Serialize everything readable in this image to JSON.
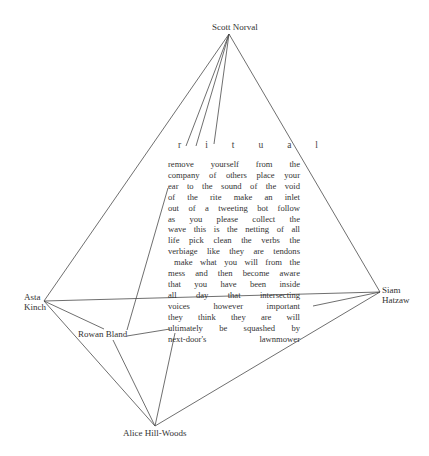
{
  "nodes": {
    "scott": "Scott Norval",
    "asta_1": "Asta",
    "asta_2": "Kinch",
    "siam_1": "Siam",
    "siam_2": "Hatzaw",
    "rowan": "Rowan Bland",
    "alice": "Alice Hill-Woods"
  },
  "title_letters": [
    "r",
    "i",
    "t",
    "u",
    "a",
    "l"
  ],
  "poem_lines": [
    "remove yourself from the",
    "company of others place your",
    "ear to the sound of the void",
    "of the rite   make an inlet",
    "out of a tweeting bot  follow",
    "as you please    collect the",
    "wave  this is the netting of all",
    "life  pick clean the verbs the",
    "verbiage like they are tendons",
    "make what you will from the",
    "mess and then become aware",
    "that you have been inside",
    "all day     that intersecting",
    "voices however important",
    "they think they are will",
    "ultimately be squashed by",
    "next-door's       lawnmower"
  ],
  "line_color": "#4a4a4a"
}
